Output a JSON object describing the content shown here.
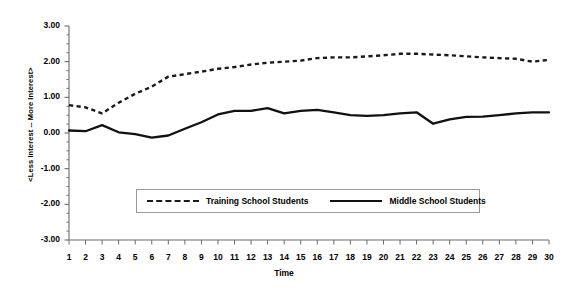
{
  "chart_data": {
    "type": "line",
    "title": "",
    "xlabel": "Time",
    "ylabel": "<Less Interest -- More Interest>",
    "x": [
      1,
      2,
      3,
      4,
      5,
      6,
      7,
      8,
      9,
      10,
      11,
      12,
      13,
      14,
      15,
      16,
      17,
      18,
      19,
      20,
      21,
      22,
      23,
      24,
      25,
      26,
      27,
      28,
      29,
      30
    ],
    "xlim": [
      1,
      30
    ],
    "ylim": [
      -3.0,
      3.0
    ],
    "yticks": [
      3.0,
      2.0,
      1.0,
      0.0,
      -1.0,
      -2.0,
      -3.0
    ],
    "ytick_labels": [
      "3.00",
      "2.00",
      "1.00",
      "0.00",
      "-1.00",
      "-2.00",
      "-3.00"
    ],
    "ytick_minor_step": 0.25,
    "xtick_labels": [
      "1",
      "2",
      "3",
      "4",
      "5",
      "6",
      "7",
      "8",
      "9",
      "10",
      "11",
      "12",
      "13",
      "14",
      "15",
      "16",
      "17",
      "18",
      "19",
      "20",
      "21",
      "22",
      "23",
      "24",
      "25",
      "26",
      "27",
      "28",
      "29",
      "30"
    ],
    "grid": false,
    "legend_position": "inside-lower-center",
    "series": [
      {
        "name": "Training School Students",
        "style": "dashed",
        "color": "#1a1a1a",
        "values": [
          0.78,
          0.72,
          0.55,
          0.85,
          1.1,
          1.3,
          1.58,
          1.65,
          1.72,
          1.8,
          1.85,
          1.92,
          1.97,
          2.0,
          2.03,
          2.1,
          2.12,
          2.12,
          2.15,
          2.18,
          2.22,
          2.22,
          2.2,
          2.18,
          2.15,
          2.12,
          2.1,
          2.08,
          2.0,
          2.05
        ]
      },
      {
        "name": "Middle School Students",
        "style": "solid",
        "color": "#111111",
        "values": [
          0.07,
          0.05,
          0.22,
          0.02,
          -0.03,
          -0.13,
          -0.07,
          0.12,
          0.3,
          0.52,
          0.62,
          0.62,
          0.7,
          0.55,
          0.62,
          0.65,
          0.58,
          0.5,
          0.48,
          0.5,
          0.55,
          0.58,
          0.26,
          0.38,
          0.45,
          0.46,
          0.5,
          0.55,
          0.58,
          0.58
        ]
      }
    ]
  },
  "axis_title_x": "Time",
  "axis_title_y": "<Less Interest -- More Interest>",
  "legend": {
    "entries": [
      {
        "label": "Training School Students",
        "style": "dashed"
      },
      {
        "label": "Middle School Students",
        "style": "solid"
      }
    ]
  }
}
